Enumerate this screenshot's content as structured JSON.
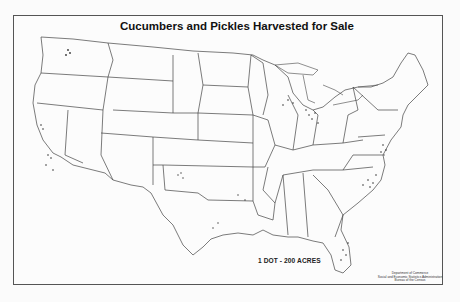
{
  "title": "Cucumbers and Pickles Harvested for Sale",
  "legend": {
    "label": "1 DOT - 200 ACRES",
    "dot_value": 200,
    "unit": "acres"
  },
  "credit": {
    "line1": "Department of Commerce",
    "line2": "Social and Economic Statistics Administration",
    "line3": "Bureau of the Census"
  },
  "map": {
    "type": "dot-density",
    "region": "Contiguous United States",
    "boundaries": "state outlines",
    "colors": {
      "background": "#fcfcfc",
      "lines": "#444444",
      "dots": "#333333"
    },
    "dense_areas": [
      "Michigan",
      "Wisconsin",
      "North Carolina",
      "Florida",
      "Delaware/Maryland",
      "California",
      "Washington",
      "Texas"
    ]
  }
}
